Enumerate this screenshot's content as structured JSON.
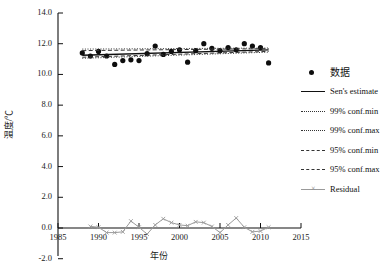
{
  "chart_data": {
    "type": "scatter",
    "title": "",
    "xlabel": "年份",
    "ylabel": "温度/℃",
    "xlim": [
      1985,
      2015
    ],
    "ylim": [
      -2.0,
      14.0
    ],
    "xticks": [
      "1985",
      "1990",
      "1995",
      "2000",
      "2005",
      "2010",
      "2015"
    ],
    "xtick_values": [
      1985,
      1990,
      1995,
      2000,
      2005,
      2010,
      2015
    ],
    "yticks": [
      "-2.0",
      "0.0",
      "2.0",
      "4.0",
      "6.0",
      "8.0",
      "10.0",
      "12.0",
      "14.0"
    ],
    "ytick_values": [
      -2.0,
      0.0,
      2.0,
      4.0,
      6.0,
      8.0,
      10.0,
      12.0,
      14.0
    ],
    "grid": false,
    "legend_position": "right",
    "series": [
      {
        "name": "数据",
        "type": "scatter",
        "marker": "filled-circle",
        "color": "#0d0d0d",
        "x": [
          1988,
          1989,
          1990,
          1991,
          1992,
          1993,
          1994,
          1995,
          1996,
          1997,
          1998,
          1999,
          2000,
          2001,
          2002,
          2003,
          2004,
          2005,
          2006,
          2007,
          2008,
          2009,
          2010,
          2011
        ],
        "values": [
          11.4,
          11.2,
          11.5,
          11.2,
          10.65,
          10.9,
          10.95,
          10.9,
          11.35,
          11.85,
          11.3,
          11.5,
          11.6,
          10.8,
          11.55,
          12.0,
          11.7,
          11.55,
          11.75,
          11.6,
          12.0,
          11.85,
          11.75,
          10.75
        ]
      },
      {
        "name": "Sen's estimate",
        "type": "line",
        "style": "solid",
        "color": "#111111",
        "x": [
          1988,
          2011
        ],
        "values": [
          11.25,
          11.6
        ]
      },
      {
        "name": "99% conf.min",
        "type": "line",
        "style": "dotted",
        "color": "#333333",
        "x": [
          1988,
          2011
        ],
        "values": [
          11.05,
          11.45
        ]
      },
      {
        "name": "99% conf.max",
        "type": "line",
        "style": "dotted",
        "color": "#333333",
        "x": [
          1988,
          2011
        ],
        "values": [
          11.65,
          11.72
        ]
      },
      {
        "name": "95% conf.min",
        "type": "line",
        "style": "dashed",
        "color": "#333333",
        "x": [
          1988,
          2011
        ],
        "values": [
          11.12,
          11.5
        ]
      },
      {
        "name": "95% conf.max",
        "type": "line",
        "style": "dashed",
        "color": "#333333",
        "x": [
          1988,
          2011
        ],
        "values": [
          11.55,
          11.68
        ]
      },
      {
        "name": "Residual",
        "type": "line",
        "style": "solid-with-x-markers",
        "color": "#9a9a9a",
        "x": [
          1989,
          1990,
          1991,
          1992,
          1993,
          1994,
          1995,
          1996,
          1997,
          1998,
          1999,
          2000,
          2001,
          2002,
          2003,
          2004,
          2005,
          2006,
          2007,
          2008,
          2009,
          2010,
          2011
        ],
        "values": [
          0.1,
          0.05,
          -0.3,
          -0.3,
          -0.25,
          0.45,
          0.05,
          -0.4,
          0.2,
          0.6,
          0.35,
          0.2,
          0.15,
          0.4,
          0.35,
          0.1,
          -0.3,
          0.2,
          0.65,
          0.05,
          -0.25,
          -0.2,
          0.05
        ]
      }
    ]
  },
  "legend": {
    "items": [
      {
        "label": "数据",
        "key": "dot"
      },
      {
        "label": "Sen's estimate",
        "key": "solid"
      },
      {
        "label": "99% conf.min",
        "key": "dotted"
      },
      {
        "label": "99% conf.max",
        "key": "dotted"
      },
      {
        "label": "95% conf.min",
        "key": "dashed"
      },
      {
        "label": "95% conf.max",
        "key": "dashed"
      },
      {
        "label": "Residual",
        "key": "residual"
      }
    ]
  }
}
